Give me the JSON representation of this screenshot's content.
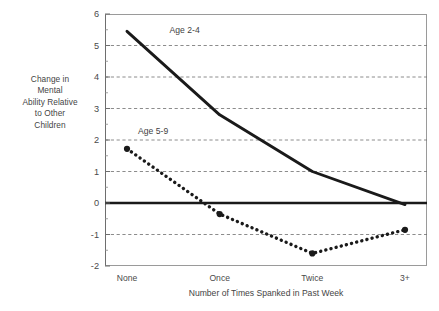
{
  "chart_data": {
    "type": "line",
    "title": "",
    "xlabel": "Number of Times Spanked in Past Week",
    "ylabel": "Change in Mental Ability Relative to Other Children",
    "categories": [
      "None",
      "Once",
      "Twice",
      "3+"
    ],
    "ylim": [
      -2,
      6
    ],
    "yticks": [
      -2,
      -1,
      0,
      1,
      2,
      3,
      4,
      5,
      6
    ],
    "ytick_labels": [
      "-2",
      "-1",
      "0",
      "1",
      "2",
      "3",
      "4",
      "5",
      "6"
    ],
    "grid": "horizontal-dashed",
    "zero_line": true,
    "legend": "inline-annotations",
    "series": [
      {
        "name": "Age 2-4",
        "values": [
          5.45,
          2.8,
          1.0,
          -0.05
        ],
        "style": "solid",
        "marker": "none",
        "color": "#1a1a1a",
        "label_x": 0.46,
        "label_y": 5.45
      },
      {
        "name": "Age 5-9",
        "values": [
          1.72,
          -0.35,
          -1.6,
          -0.85
        ],
        "style": "dotted",
        "marker": "circle",
        "color": "#1a1a1a",
        "label_x": 0.12,
        "label_y": 2.24
      }
    ]
  },
  "axis": {
    "y_caption": "Change in\nMental\nAbility Relative\nto Other\nChildren",
    "x_title": "Number of Times Spanked in Past Week"
  },
  "colors": {
    "line": "#1a1a1a",
    "grid": "#6f6f6f",
    "frame": "#9a9a9a",
    "text": "#444444",
    "background": "#ffffff"
  }
}
